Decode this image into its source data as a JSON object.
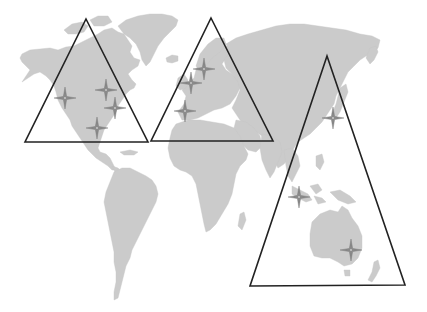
{
  "map": {
    "width": 427,
    "height": 312,
    "background_color": "#ffffff",
    "land_color": "#cbcbcb",
    "triangle_stroke_color": "#222222",
    "marker_color": "#8a8a8a",
    "regions": [
      {
        "id": "americas",
        "label": "North America region",
        "triangle": [
          [
            86,
            19
          ],
          [
            148,
            142
          ],
          [
            25,
            142
          ]
        ],
        "markers": [
          [
            65,
            98
          ],
          [
            106,
            90
          ],
          [
            115,
            108
          ],
          [
            97,
            128
          ]
        ]
      },
      {
        "id": "europe",
        "label": "Europe region",
        "triangle": [
          [
            211,
            18
          ],
          [
            273,
            141
          ],
          [
            151,
            141
          ]
        ],
        "markers": [
          [
            204,
            69
          ],
          [
            191,
            83
          ],
          [
            185,
            111
          ]
        ]
      },
      {
        "id": "asia-pacific",
        "label": "Asia-Pacific region",
        "triangle": [
          [
            327,
            56
          ],
          [
            405,
            285
          ],
          [
            250,
            286
          ]
        ],
        "markers": [
          [
            333,
            118
          ],
          [
            299,
            197
          ],
          [
            351,
            250
          ]
        ]
      }
    ],
    "marker_icon": "four-point-star-icon"
  }
}
